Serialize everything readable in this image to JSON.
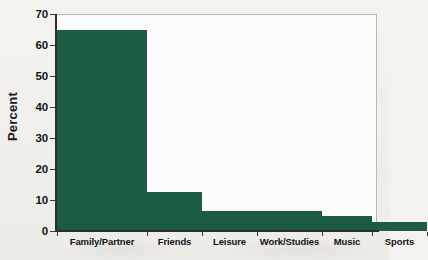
{
  "chart_data": {
    "type": "bar",
    "title": "",
    "subtitle": "",
    "xlabel": "",
    "ylabel": "Percent",
    "categories": [
      "Family/Partner",
      "Friends",
      "Leisure",
      "Work/Studies",
      "Music",
      "Sports"
    ],
    "values": [
      65,
      12.5,
      6.5,
      6.5,
      4.8,
      3
    ],
    "ylim": [
      0,
      70
    ],
    "ytick_labels": [
      "0",
      "10",
      "20",
      "30",
      "40",
      "50",
      "60",
      "70"
    ],
    "ytick_values": [
      0,
      10,
      20,
      30,
      40,
      50,
      60,
      70
    ],
    "grid": false,
    "legend": false,
    "legend_position": "none",
    "bar_gap": 0,
    "series": [
      {
        "name": "Percent",
        "values": [
          65,
          12.5,
          6.5,
          6.5,
          4.8,
          3
        ]
      }
    ],
    "bar_widths_px": [
      90,
      55,
      55,
      65,
      50,
      55
    ],
    "colors": {
      "bar": "#1b5c43",
      "axis": "#2e2e2e",
      "text": "#131313",
      "plot_background": "#fbfbf9",
      "figure_background": "#f3f2ee",
      "plot_border": "#b9b9b4"
    }
  }
}
